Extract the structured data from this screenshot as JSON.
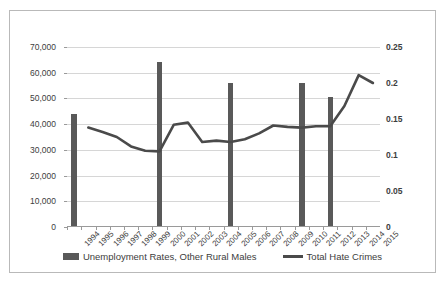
{
  "chart_data": {
    "type": "bar",
    "title": "",
    "xlabel": "",
    "ylabel": "",
    "grid": true,
    "legend_position": "bottom",
    "categories": [
      "1994",
      "1995",
      "1996",
      "1997",
      "1998",
      "1999",
      "2000",
      "2001",
      "2002",
      "2003",
      "2004",
      "2005",
      "2006",
      "2007",
      "2008",
      "2009",
      "2010",
      "2011",
      "2012",
      "2013",
      "2014",
      "2015"
    ],
    "left_axis": {
      "label": "",
      "ylim": [
        0,
        70000
      ],
      "ticks": [
        "0",
        "10,000",
        "20,000",
        "30,000",
        "40,000",
        "50,000",
        "60,000",
        "70,000"
      ],
      "tick_values": [
        0,
        10000,
        20000,
        30000,
        40000,
        50000,
        60000,
        70000
      ]
    },
    "right_axis": {
      "label": "",
      "ylim": [
        0,
        0.25
      ],
      "ticks": [
        "0",
        "0.05",
        "0.1",
        "0.15",
        "0.2",
        "0.25"
      ],
      "tick_values": [
        0,
        0.05,
        0.1,
        0.15,
        0.2,
        0.25
      ]
    },
    "series": [
      {
        "name": "Unemployment Rates, Other Rural Males",
        "type": "bar",
        "axis": "left",
        "color": "#595959",
        "values": [
          44000,
          null,
          null,
          null,
          null,
          null,
          64000,
          null,
          null,
          null,
          null,
          56000,
          null,
          null,
          null,
          null,
          56000,
          null,
          50500,
          null,
          null,
          null
        ]
      },
      {
        "name": "Total Hate Crimes",
        "type": "line",
        "axis": "right",
        "color": "#4a4a4a",
        "values": [
          null,
          0.138,
          0.132,
          0.125,
          0.112,
          0.106,
          0.105,
          0.142,
          0.145,
          0.118,
          0.12,
          0.118,
          0.122,
          0.13,
          0.141,
          0.139,
          0.138,
          0.14,
          0.14,
          0.168,
          0.211,
          0.2
        ]
      }
    ]
  },
  "legend": {
    "items": [
      {
        "label": "Unemployment Rates, Other Rural Males",
        "marker": "bar-swatch"
      },
      {
        "label": "Total Hate Crimes",
        "marker": "line-swatch"
      }
    ]
  }
}
